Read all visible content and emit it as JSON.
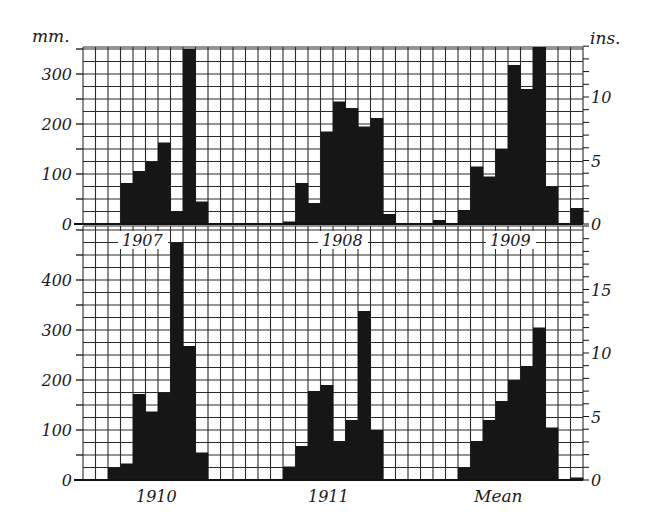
{
  "chart_data": {
    "type": "bar",
    "left_unit": "mm.",
    "right_unit": "ins.",
    "grid": true,
    "cell_mm": 25,
    "panels_top": {
      "ylim_mm": [
        0,
        354
      ],
      "left_ticks": [
        0,
        100,
        200,
        300
      ],
      "right_ticks": [
        0,
        5,
        10
      ],
      "series": [
        {
          "name": "1907",
          "start_col": 3,
          "values": [
            82,
            106,
            125,
            163,
            25,
            350,
            45
          ]
        },
        {
          "name": "1908",
          "start_col": 16,
          "values": [
            5,
            82,
            42,
            185,
            245,
            232,
            195,
            212,
            20
          ]
        },
        {
          "name": "1909",
          "start_col": 28,
          "values": [
            8,
            0,
            28,
            115,
            95,
            150,
            318,
            270,
            355,
            75,
            0,
            32
          ]
        }
      ]
    },
    "panels_bottom": {
      "ylim_mm": [
        0,
        508
      ],
      "left_ticks": [
        0,
        100,
        200,
        300,
        400
      ],
      "right_ticks": [
        0,
        5,
        10,
        15
      ],
      "series": [
        {
          "name": "1910",
          "start_col": 2,
          "values": [
            25,
            33,
            172,
            137,
            175,
            475,
            268,
            55
          ]
        },
        {
          "name": "1911",
          "start_col": 16,
          "values": [
            27,
            68,
            178,
            190,
            78,
            120,
            338,
            100
          ]
        },
        {
          "name": "Mean",
          "start_col": 30,
          "values": [
            25,
            78,
            120,
            158,
            200,
            228,
            305,
            105,
            0,
            5
          ]
        }
      ]
    },
    "labels": {
      "top": [
        "1907",
        "1908",
        "1909"
      ],
      "bottom": [
        "1910",
        "1911",
        "Mean"
      ]
    },
    "colors": {
      "bar": "#161616",
      "grid": "#2a2a2a",
      "background": "#ffffff"
    }
  }
}
